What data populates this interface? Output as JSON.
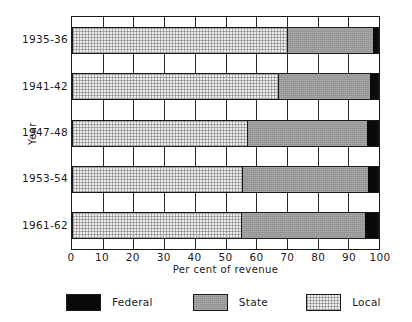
{
  "chart_data": {
    "type": "bar",
    "orientation": "horizontal",
    "stacked": true,
    "title": "",
    "xlabel": "Per cent of revenue",
    "ylabel": "Year",
    "xlim": [
      0,
      100
    ],
    "xticks": [
      0,
      10,
      20,
      30,
      40,
      50,
      60,
      70,
      80,
      90,
      100
    ],
    "xtick_labels": [
      "0",
      "10",
      "20",
      "30",
      "40",
      "50",
      "60",
      "70",
      "80",
      "90",
      "100"
    ],
    "grid": true,
    "grid_axis": "x",
    "legend_position": "bottom",
    "categories": [
      "1935-36",
      "1941-42",
      "1947-48",
      "1953-54",
      "1961-62"
    ],
    "series": [
      {
        "name": "Local",
        "color": "#ededed",
        "values": [
          70,
          67,
          57,
          55.5,
          55
        ]
      },
      {
        "name": "State",
        "color": "#9a9a9a",
        "values": [
          28,
          30,
          39,
          41,
          40.5
        ]
      },
      {
        "name": "Federal",
        "color": "#0a0a0a",
        "values": [
          2,
          3,
          4,
          3.5,
          4.5
        ]
      }
    ],
    "legend": [
      {
        "label": "Federal",
        "color": "#0a0a0a"
      },
      {
        "label": "State",
        "color": "#9a9a9a"
      },
      {
        "label": "Local",
        "color": "#ededed"
      }
    ]
  },
  "axes": {
    "y_title": "Year",
    "x_title": "Per cent of revenue",
    "x_tick_labels": [
      "0",
      "10",
      "20",
      "30",
      "40",
      "50",
      "60",
      "70",
      "80",
      "90",
      "100"
    ],
    "category_labels": [
      "1935-36",
      "1941-42",
      "1947-48",
      "1953-54",
      "1961-62"
    ]
  },
  "legend": {
    "items": [
      {
        "label": "Federal"
      },
      {
        "label": "State"
      },
      {
        "label": "Local"
      }
    ]
  }
}
